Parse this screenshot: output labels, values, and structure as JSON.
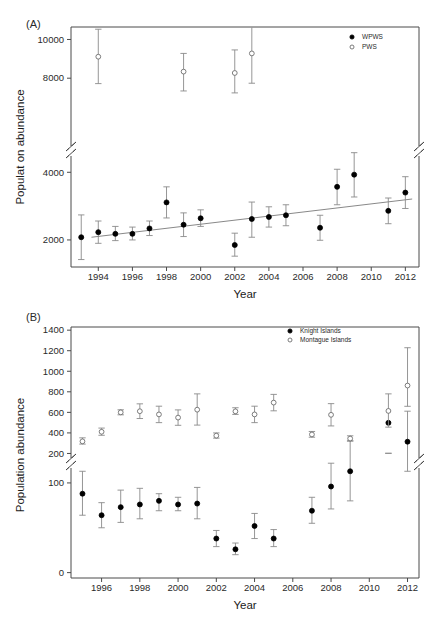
{
  "figure": {
    "panel_a_tag": "(A)",
    "panel_b_tag": "(B)"
  },
  "chart_data": [
    {
      "type": "scatter",
      "panel": "(A)",
      "title": "",
      "xlabel": "Year",
      "ylabel": "Populat on abundance",
      "xlim": [
        1992.4,
        2012.8
      ],
      "xticks": [
        1994,
        1996,
        1998,
        2000,
        2002,
        2004,
        2006,
        2008,
        2010,
        2012
      ],
      "xticklabels": [
        "1994",
        "1996",
        "1998",
        "2000",
        "2002",
        "2004",
        "2006",
        "2008",
        "2010",
        "2012"
      ],
      "yticks": [
        2000,
        4000,
        8000,
        10000
      ],
      "yticklabels": [
        "2000",
        "4000",
        "8000",
        "10000"
      ],
      "axis_break": {
        "low": 4600,
        "high": 7400,
        "note": "broken y-axis between 4000 and 8000"
      },
      "grid": false,
      "legend_position": "top-right",
      "series": [
        {
          "name": "WPWS",
          "marker": "filled-circle",
          "x": [
            1993,
            1994,
            1995,
            1996,
            1997,
            1998,
            1999,
            2000,
            2002,
            2003,
            2004,
            2005,
            2007,
            2008,
            2009,
            2011,
            2012
          ],
          "values": [
            2080,
            2230,
            2180,
            2180,
            2340,
            3110,
            2450,
            2640,
            1850,
            2620,
            2680,
            2730,
            2360,
            3570,
            3930,
            2860,
            3400
          ],
          "err_low": [
            1420,
            1900,
            1980,
            2000,
            2130,
            2650,
            2100,
            2400,
            1520,
            2080,
            2380,
            2420,
            1990,
            3040,
            3270,
            2480,
            2930
          ],
          "err_high": [
            2740,
            2560,
            2400,
            2380,
            2560,
            3570,
            2800,
            2890,
            2200,
            3120,
            2980,
            3040,
            2730,
            4090,
            4580,
            3240,
            3870
          ]
        },
        {
          "name": "PWS",
          "marker": "open-circle",
          "x": [
            1994,
            1999,
            2002,
            2003
          ],
          "values": [
            9110,
            8340,
            8270,
            9280
          ],
          "err_low": [
            7720,
            7340,
            7240,
            7740
          ],
          "err_high": [
            10530,
            9280,
            9460,
            11100
          ]
        }
      ],
      "trendline": {
        "x": [
          1993.6,
          2012.4
        ],
        "y": [
          2080,
          3210
        ]
      }
    },
    {
      "type": "scatter",
      "panel": "(B)",
      "title": "",
      "xlabel": "Year",
      "ylabel": "Population abundance",
      "xlim": [
        1994.4,
        2012.6
      ],
      "xticks": [
        1996,
        1998,
        2000,
        2002,
        2004,
        2006,
        2008,
        2010,
        2012
      ],
      "xticklabels": [
        "1996",
        "1998",
        "2000",
        "2002",
        "2004",
        "2006",
        "2008",
        "2010",
        "2012"
      ],
      "yticks": [
        0,
        100,
        200,
        400,
        600,
        800,
        1000,
        1200,
        1400
      ],
      "yticklabels": [
        "0",
        "100",
        "200",
        "400",
        "600",
        "800",
        "1000",
        "1200",
        "1400"
      ],
      "axis_break": {
        "low": 120,
        "high": 185,
        "note": "broken y-axis between 100 and 200"
      },
      "grid": false,
      "legend_position": "top-right",
      "series": [
        {
          "name": "Knight Islands",
          "marker": "filled-circle",
          "x": [
            1995,
            1996,
            1997,
            1998,
            1999,
            2000,
            2001,
            2002,
            2003,
            2004,
            2005,
            2007,
            2008,
            2009,
            2011,
            2012
          ],
          "values": [
            88,
            64,
            73,
            76,
            80,
            76,
            77,
            38,
            26,
            52,
            38,
            69,
            96,
            113,
            167,
            146
          ],
          "err_low": [
            64,
            50,
            56,
            60,
            69,
            69,
            60,
            29,
            20,
            38,
            29,
            55,
            71,
            80,
            133,
            113
          ],
          "err_high": [
            113,
            78,
            92,
            94,
            88,
            84,
            95,
            47,
            33,
            66,
            48,
            84,
            122,
            147,
            202,
            180
          ]
        },
        {
          "name": "Montague Islands",
          "marker": "open-circle",
          "x": [
            1995,
            1996,
            1997,
            1998,
            1999,
            2000,
            2001,
            2002,
            2003,
            2004,
            2005,
            2007,
            2008,
            2009,
            2011,
            2012
          ],
          "values": [
            318,
            411,
            600,
            611,
            580,
            549,
            626,
            373,
            610,
            580,
            695,
            385,
            576,
            345,
            614,
            861
          ],
          "err_low": [
            291,
            377,
            576,
            540,
            500,
            474,
            476,
            349,
            580,
            500,
            615,
            358,
            468,
            320,
            456,
            659
          ],
          "err_high": [
            352,
            447,
            625,
            683,
            660,
            624,
            780,
            400,
            645,
            660,
            775,
            414,
            685,
            372,
            780,
            1229
          ]
        }
      ]
    }
  ]
}
